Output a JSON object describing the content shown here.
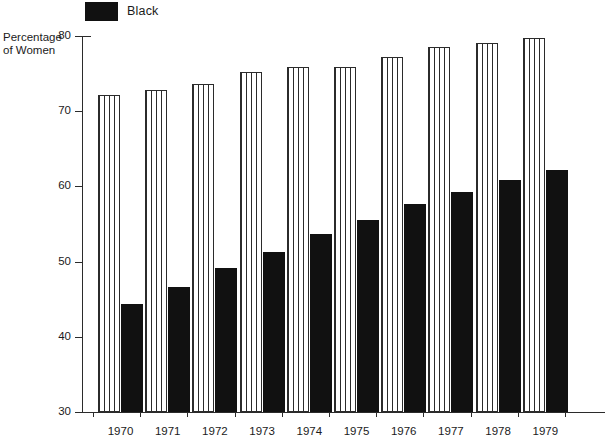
{
  "legend": {
    "entries": [
      {
        "label": "Black",
        "swatch": "solid-black-swatch",
        "color": "#111111"
      }
    ]
  },
  "axis_title": {
    "line1": "Percentage",
    "line2": "of Women"
  },
  "chart_data": {
    "type": "bar",
    "title": "",
    "subtitle": "",
    "xlabel": "",
    "ylabel": "Percentage of Women",
    "categories": [
      "1970",
      "1971",
      "1972",
      "1973",
      "1974",
      "1975",
      "1976",
      "1977",
      "1978",
      "1979"
    ],
    "series": [
      {
        "name": "White",
        "style": "vertical-striped",
        "color": "#ffffff",
        "values": [
          72.2,
          72.8,
          73.6,
          75.2,
          75.9,
          75.9,
          77.2,
          78.5,
          79.1,
          79.8
        ]
      },
      {
        "name": "Black",
        "style": "solid",
        "color": "#111111",
        "values": [
          44.4,
          46.6,
          49.2,
          51.3,
          53.7,
          55.6,
          57.6,
          59.2,
          60.8,
          62.2
        ]
      }
    ],
    "ylim": [
      30,
      80
    ],
    "yticks": [
      30,
      40,
      50,
      60,
      70,
      80
    ],
    "ytick_labels": [
      "30",
      "40",
      "50",
      "60",
      "70",
      "80"
    ],
    "grid": false,
    "legend_position": "top-left"
  }
}
